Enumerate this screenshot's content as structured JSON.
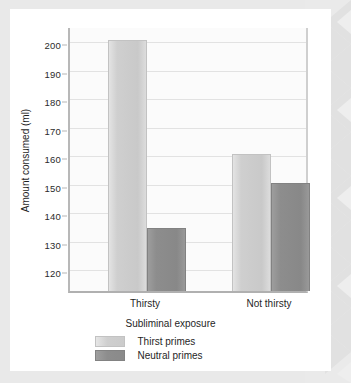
{
  "chart_data": {
    "type": "bar",
    "title": "",
    "xlabel": "Subliminal exposure",
    "ylabel": "Amount consumed (ml)",
    "categories": [
      "Thirsty",
      "Not thirsty"
    ],
    "series": [
      {
        "name": "Thirst primes",
        "values": [
          201,
          161
        ],
        "color": "#cdcdcd"
      },
      {
        "name": "Neutral primes",
        "values": [
          135,
          151
        ],
        "color": "#8f8f8f"
      }
    ],
    "ylim": [
      113,
      206
    ],
    "yticks": [
      120,
      130,
      140,
      150,
      160,
      170,
      180,
      190,
      200
    ],
    "ytick_labels": [
      "120",
      "130",
      "140",
      "150",
      "160",
      "170",
      "180",
      "190",
      "200"
    ],
    "grid": true,
    "legend_position": "bottom"
  },
  "colors": {
    "page_background": "#e9e9e9",
    "card_background": "#ffffff",
    "plot_background": "#fbfbfb",
    "gridline": "#e2e2e2",
    "axis": "#b0b0b0",
    "text": "#1f1f1f",
    "series_light": "#cdcdcd",
    "series_dark": "#8f8f8f"
  }
}
